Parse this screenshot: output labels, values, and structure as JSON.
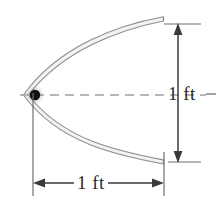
{
  "figure": {
    "type": "engineering-dimension-diagram",
    "background_color": "#ffffff"
  },
  "dimensions": {
    "vertical": {
      "label": "1 ft",
      "orientation": "vertical",
      "arrow_style": "double-headed",
      "measures": "dish-opening-diameter"
    },
    "horizontal": {
      "label": "1 ft",
      "orientation": "horizontal",
      "arrow_style": "double-headed",
      "measures": "dish-depth"
    }
  },
  "elements": {
    "focus_point": {
      "name": "focus-dot",
      "color": "#111111"
    },
    "axis_line": {
      "name": "axis-of-symmetry",
      "style": "dashed",
      "color": "#9a9a9a"
    },
    "dish_curve": {
      "name": "parabolic-wall",
      "color": "#8e8e8e",
      "fill": "#f4f4f4"
    }
  },
  "colors": {
    "curve_stroke": "#8e8e8e",
    "curve_fill": "#f3f3f3",
    "dimension_line": "#3a3a3a",
    "extension_line": "#6f6f6f",
    "axis_dash": "#a0a0a0",
    "text": "#2b2b2b",
    "focus": "#111111"
  }
}
